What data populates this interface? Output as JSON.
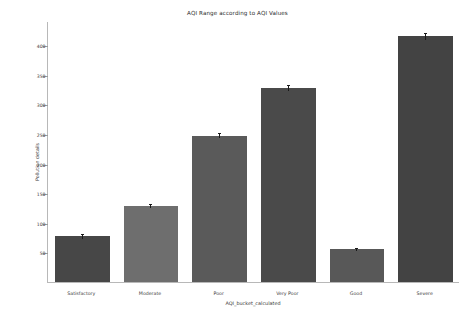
{
  "chart_data": {
    "type": "bar",
    "title": "AQI Range according to AQI Values",
    "xlabel": "AQI_bucket_calculated",
    "ylabel": "Pollution details",
    "categories": [
      "Satisfactory",
      "Moderate",
      "Poor",
      "Very Poor",
      "Good",
      "Severe"
    ],
    "values": [
      77,
      128,
      247,
      328,
      55,
      415
    ],
    "errors": [
      4,
      3,
      4,
      5,
      3,
      6
    ],
    "bar_colors": [
      "#474747",
      "#6e6e6e",
      "#5a5a5a",
      "#4a4a4a",
      "#585858",
      "#434343"
    ],
    "ylim": [
      0,
      441
    ],
    "yticks": [
      50,
      100,
      150,
      200,
      250,
      300,
      350,
      400
    ],
    "ytick_labels": [
      "50",
      "100",
      "150",
      "200",
      "250",
      "300",
      "350",
      "400"
    ],
    "grid": false,
    "legend": "none",
    "error_bar_color": "#1a1a1a"
  },
  "figure": {
    "background": "#ffffff",
    "axis_color": "#b8b8b8"
  }
}
